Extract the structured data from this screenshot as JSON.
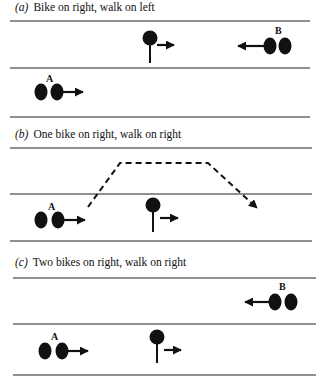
{
  "panels": [
    {
      "tag": "(a)",
      "title": "Bike on right, walk on left"
    },
    {
      "tag": "(b)",
      "title": "One bike on right, walk on right"
    },
    {
      "tag": "(c)",
      "title": "Two bikes on right, walk on right"
    }
  ],
  "labels": {
    "cyclist_a": "A",
    "cyclist_b": "B"
  },
  "colors": {
    "ink": "#111111",
    "line": "#222222",
    "background": "#ffffff"
  }
}
